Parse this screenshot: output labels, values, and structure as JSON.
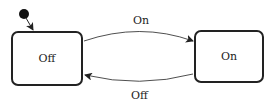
{
  "diagram": {
    "type": "state-machine",
    "initial_state": "Off",
    "states": [
      {
        "id": "off",
        "label": "Off"
      },
      {
        "id": "on",
        "label": "On"
      }
    ],
    "transitions": [
      {
        "from": "off",
        "to": "on",
        "label": "On"
      },
      {
        "from": "on",
        "to": "off",
        "label": "Off"
      }
    ]
  }
}
